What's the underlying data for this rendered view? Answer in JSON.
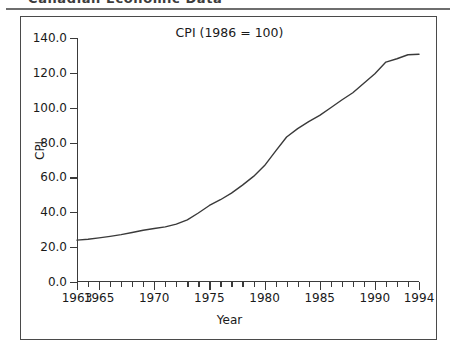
{
  "page": {
    "header_text": "Canadian Economic Data",
    "header_rule": "horizontal-rule"
  },
  "figure": {
    "title": "CPI (1986 = 100)",
    "xlabel": "Year",
    "ylabel": "CPI"
  },
  "chart_data": {
    "type": "line",
    "title": "CPI (1986 = 100)",
    "xlabel": "Year",
    "ylabel": "CPI",
    "xlim": [
      1963,
      1994
    ],
    "ylim": [
      0,
      140
    ],
    "grid": false,
    "legend": null,
    "y_ticks": [
      0.0,
      20.0,
      40.0,
      60.0,
      80.0,
      100.0,
      120.0,
      140.0
    ],
    "y_tick_labels": [
      "0.0",
      "20.0",
      "40.0",
      "60.0",
      "80.0",
      "100.0",
      "120.0",
      "140.0"
    ],
    "x_ticks": [
      1963,
      1964,
      1965,
      1966,
      1967,
      1968,
      1969,
      1970,
      1971,
      1972,
      1973,
      1974,
      1975,
      1976,
      1977,
      1978,
      1979,
      1980,
      1981,
      1982,
      1983,
      1984,
      1985,
      1986,
      1987,
      1988,
      1989,
      1990,
      1991,
      1992,
      1993,
      1994
    ],
    "x_tick_labels_shown": [
      "1963",
      "1965",
      "1970",
      "1975",
      "1980",
      "1985",
      "1990",
      "1994"
    ],
    "series": [
      {
        "name": "CPI",
        "color": "#3a3a3a",
        "x": [
          1963,
          1964,
          1965,
          1966,
          1967,
          1968,
          1969,
          1970,
          1971,
          1972,
          1973,
          1974,
          1975,
          1976,
          1977,
          1978,
          1979,
          1980,
          1981,
          1982,
          1983,
          1984,
          1985,
          1986,
          1987,
          1988,
          1989,
          1990,
          1991,
          1992,
          1993,
          1994
        ],
        "values": [
          24.0,
          24.5,
          25.3,
          26.2,
          27.2,
          28.4,
          29.7,
          30.7,
          31.6,
          33.2,
          35.7,
          39.6,
          43.9,
          47.2,
          51.0,
          55.6,
          60.6,
          66.8,
          75.1,
          83.2,
          88.0,
          92.0,
          95.6,
          100.0,
          104.4,
          108.6,
          114.0,
          119.5,
          126.2,
          128.1,
          130.4,
          130.7
        ]
      }
    ]
  }
}
